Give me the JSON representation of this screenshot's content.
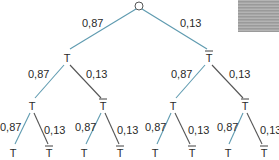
{
  "colors": {
    "blue_edge": "#5f9bb0",
    "dark_edge": "#555555",
    "text": "#2a2a2a"
  },
  "tree": {
    "root": {
      "label": ""
    },
    "level1": [
      {
        "label": "T",
        "overline": false,
        "prob": "0,87"
      },
      {
        "label": "T",
        "overline": true,
        "prob": "0,13"
      }
    ],
    "level2": [
      {
        "label": "T",
        "overline": false,
        "prob": "0,87"
      },
      {
        "label": "T",
        "overline": true,
        "prob": "0,13"
      },
      {
        "label": "T",
        "overline": false,
        "prob": "0,87"
      },
      {
        "label": "T",
        "overline": true,
        "prob": "0,13"
      }
    ],
    "level3": [
      {
        "label": "T",
        "overline": false,
        "prob": "0,87"
      },
      {
        "label": "T",
        "overline": true,
        "prob": "0,13"
      },
      {
        "label": "T",
        "overline": false,
        "prob": "0,87"
      },
      {
        "label": "T",
        "overline": true,
        "prob": "0,13"
      },
      {
        "label": "T",
        "overline": false,
        "prob": "0,87"
      },
      {
        "label": "T",
        "overline": true,
        "prob": "0,13"
      },
      {
        "label": "T",
        "overline": false,
        "prob": "0,87"
      },
      {
        "label": "T",
        "overline": true,
        "prob": "0,13"
      }
    ]
  }
}
